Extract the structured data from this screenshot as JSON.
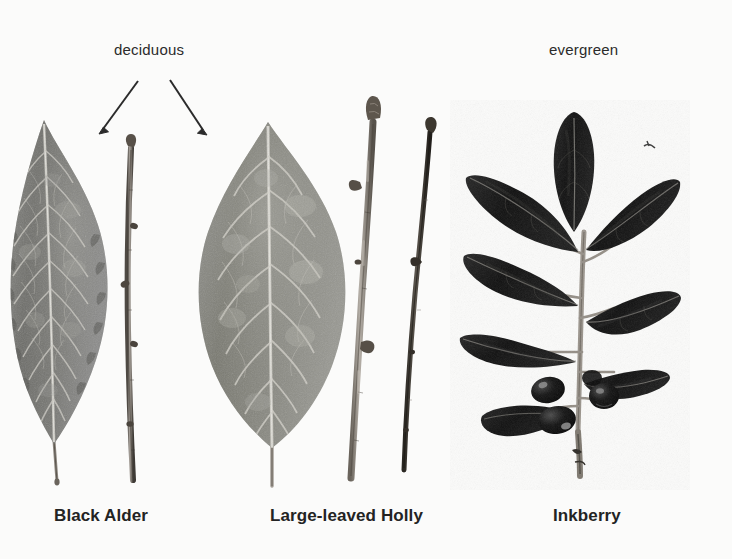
{
  "figure": {
    "background_color": "#fbfbfa",
    "text_color": "#2b2b2b",
    "width": 732,
    "height": 559
  },
  "annotations": {
    "deciduous_label": "deciduous",
    "evergreen_label": "evergreen",
    "arrows": [
      {
        "name": "arrow-to-black-alder",
        "from": [
          138,
          81
        ],
        "to": [
          100,
          133
        ]
      },
      {
        "name": "arrow-to-large-leaved-holly",
        "from": [
          170,
          80
        ],
        "to": [
          206,
          134
        ]
      }
    ]
  },
  "specimens": [
    {
      "id": "black-alder",
      "caption": "Black Alder",
      "leaf_type": "deciduous",
      "leaf_color": "#6f6f6c",
      "leaf_shape": "elliptic, acuminate tip, serrate margin",
      "has_twig": true,
      "twig_color": "#6b655e",
      "has_berries": false
    },
    {
      "id": "large-leaved-holly",
      "caption": "Large-leaved Holly",
      "leaf_type": "deciduous",
      "leaf_color": "#7c7b77",
      "leaf_shape": "broadly ovate, acuminate tip",
      "has_twig": true,
      "twig_color": "#7a736a",
      "twig_count": 2,
      "has_berries": false
    },
    {
      "id": "inkberry",
      "caption": "Inkberry",
      "leaf_type": "evergreen",
      "leaf_color": "#151515",
      "leaf_shape": "obovate, glossy, entire margin",
      "has_twig": true,
      "twig_color": "#8b8680",
      "has_berries": true,
      "berry_color": "#0d0d0d",
      "berry_count": 4,
      "leaf_count": 8
    }
  ]
}
